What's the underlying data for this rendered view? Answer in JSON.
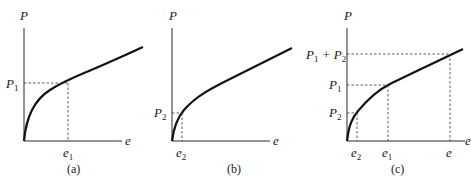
{
  "panels": [
    {
      "id": "a",
      "caption": "(a)",
      "y_axis_label": "P",
      "x_axis_label": "e",
      "y_marks": [
        {
          "base": "P",
          "sub": "1"
        }
      ],
      "x_marks": [
        {
          "base": "e",
          "sub": "1"
        }
      ]
    },
    {
      "id": "b",
      "caption": "(b)",
      "y_axis_label": "P",
      "x_axis_label": "e",
      "y_marks": [
        {
          "base": "P",
          "sub": "2"
        }
      ],
      "x_marks": [
        {
          "base": "e",
          "sub": "2"
        }
      ]
    },
    {
      "id": "c",
      "caption": "(c)",
      "y_axis_label": "P",
      "x_axis_label": "e",
      "y_marks": [
        {
          "base": "P",
          "sub": "1",
          "plus": " + ",
          "base2": "P",
          "sub2": "2"
        },
        {
          "base": "P",
          "sub": "1"
        },
        {
          "base": "P",
          "sub": "2"
        }
      ],
      "x_marks": [
        {
          "base": "e",
          "sub": "2"
        },
        {
          "base": "e",
          "sub": "1"
        },
        {
          "base": "e",
          "sub": ""
        }
      ]
    }
  ],
  "colors": {
    "ink": "#111111",
    "background": "#ffffff"
  }
}
